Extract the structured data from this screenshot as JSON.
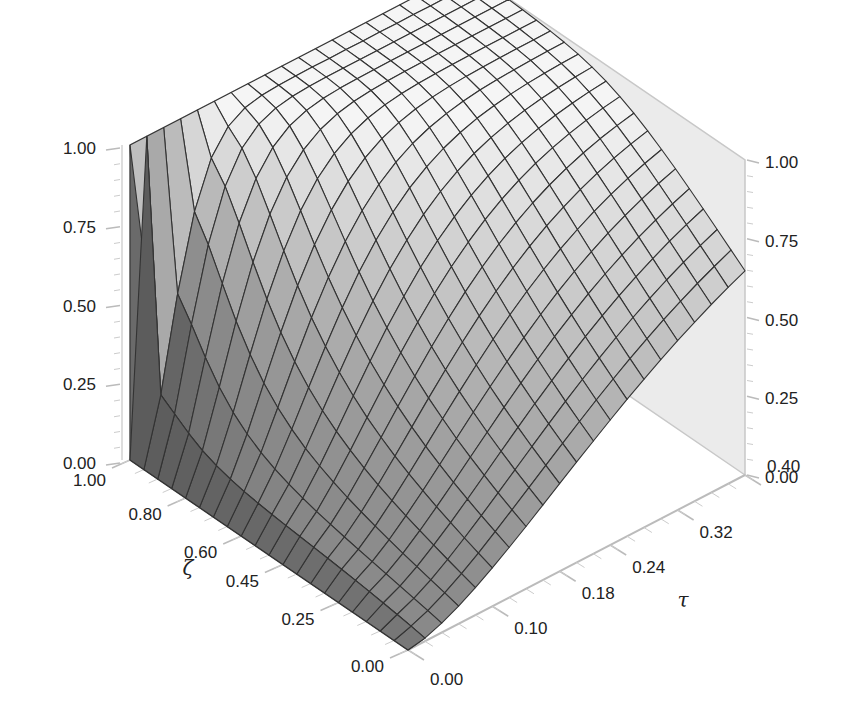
{
  "chart_data": {
    "type": "surface3d",
    "title": "",
    "axes": {
      "z": {
        "label": "ψ",
        "range": [
          0,
          1
        ],
        "ticks": [
          "0.00",
          "0.25",
          "0.50",
          "0.75",
          "1.00"
        ],
        "tick_values": [
          0,
          0.25,
          0.5,
          0.75,
          1
        ]
      },
      "x": {
        "label": "ζ",
        "range": [
          0,
          1
        ],
        "ticks": [
          "0.00",
          "0.25",
          "0.45",
          "0.60",
          "0.80",
          "1.00"
        ],
        "tick_values": [
          0,
          0.25,
          0.45,
          0.6,
          0.8,
          1
        ]
      },
      "y": {
        "label": "τ",
        "range": [
          0,
          0.4
        ],
        "ticks": [
          "0.00",
          "0.10",
          "0.18",
          "0.24",
          "0.32",
          "0.40"
        ],
        "tick_values": [
          0,
          0.1,
          0.18,
          0.24,
          0.32,
          0.4
        ]
      }
    },
    "surface_description": "ψ rises from 0 at τ=0 (for ζ<1) toward ~1 as τ increases; at ζ=1 ψ=1 for all τ; at τ=0.4 ψ≈0.85 near ζ=0 and ≈1 near ζ=1",
    "grid": {
      "zeta_lines": 20,
      "tau_lines": 20
    },
    "sample_values": [
      {
        "zeta": 1.0,
        "tau": 0.0,
        "psi": 1.0
      },
      {
        "zeta": 0.0,
        "tau": 0.0,
        "psi": 0.0
      },
      {
        "zeta": 0.0,
        "tau": 0.1,
        "psi": 0.2
      },
      {
        "zeta": 0.0,
        "tau": 0.2,
        "psi": 0.55
      },
      {
        "zeta": 0.0,
        "tau": 0.4,
        "psi": 0.85
      },
      {
        "zeta": 0.5,
        "tau": 0.1,
        "psi": 0.55
      },
      {
        "zeta": 0.5,
        "tau": 0.4,
        "psi": 0.95
      },
      {
        "zeta": 1.0,
        "tau": 0.4,
        "psi": 1.0
      }
    ],
    "colors": {
      "surface_light": "#f2f2f2",
      "surface_dark": "#555555",
      "mesh": "#333333",
      "pane": "#e6e6e6",
      "axis_line": "#bbbbbb"
    }
  }
}
